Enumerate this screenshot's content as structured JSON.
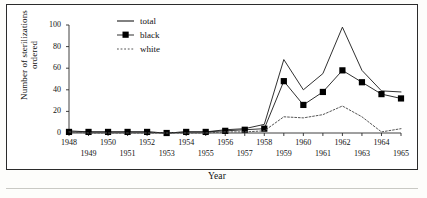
{
  "figure": {
    "background_color": "#fdfdfb",
    "frame_color": "#2b2b2b",
    "line_color": "#1a1a1a",
    "marker_color": "#000000",
    "dotted_color": "#555555"
  },
  "axes": {
    "y_title": "Number of sterilizations ordered",
    "x_title": "Year",
    "y_ticks": [
      "0",
      "20",
      "40",
      "60",
      "80",
      "100"
    ],
    "x_ticks_top": [
      "1948",
      "1950",
      "1952",
      "1954",
      "1956",
      "1958",
      "1960",
      "1962",
      "1964"
    ],
    "x_ticks_bottom": [
      "1949",
      "1951",
      "1953",
      "1955",
      "1957",
      "1959",
      "1961",
      "1963",
      "1965"
    ]
  },
  "legend": {
    "items": [
      {
        "label": "total",
        "style": "solid-line"
      },
      {
        "label": "black",
        "style": "line-with-square-marker"
      },
      {
        "label": "white",
        "style": "dotted-line"
      }
    ]
  },
  "chart_data": {
    "type": "line",
    "title": "",
    "xlabel": "Year",
    "ylabel": "Number of sterilizations ordered",
    "xlim": [
      1948,
      1965
    ],
    "ylim": [
      0,
      100
    ],
    "grid": false,
    "legend_position": "upper-left-inside",
    "x": [
      1948,
      1949,
      1950,
      1951,
      1952,
      1953,
      1954,
      1955,
      1956,
      1957,
      1958,
      1959,
      1960,
      1961,
      1962,
      1963,
      1964,
      1965
    ],
    "series": [
      {
        "name": "total",
        "style": "solid",
        "marker": "none",
        "values": [
          2,
          1,
          1,
          1,
          1,
          0,
          1,
          1,
          3,
          4,
          8,
          68,
          40,
          55,
          98,
          58,
          39,
          38
        ]
      },
      {
        "name": "black",
        "style": "solid",
        "marker": "square",
        "values": [
          1,
          1,
          1,
          1,
          1,
          0,
          1,
          1,
          2,
          3,
          4,
          48,
          26,
          38,
          58,
          47,
          36,
          32
        ]
      },
      {
        "name": "white",
        "style": "dotted",
        "marker": "none",
        "values": [
          1,
          0,
          0,
          0,
          0,
          0,
          0,
          0,
          1,
          1,
          2,
          15,
          14,
          17,
          25,
          15,
          1,
          4
        ]
      }
    ]
  }
}
